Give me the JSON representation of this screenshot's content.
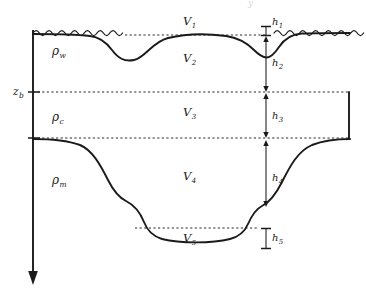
{
  "figure": {
    "caption_fragment": "y",
    "background_color": "#ffffff",
    "line_color": "#1a1a1a",
    "dash_color": "#2b2b2b"
  },
  "axis": {
    "name": "depth-axis",
    "direction": "downward",
    "tick_label": "z",
    "tick_subscript": "b",
    "tick_full": "z_b"
  },
  "densities": [
    {
      "id": "rho-w",
      "symbol": "ρ",
      "subscript": "w",
      "full": "ρ_w",
      "meaning": "water density"
    },
    {
      "id": "rho-c",
      "symbol": "ρ",
      "subscript": "c",
      "full": "ρ_c",
      "meaning": "crust density"
    },
    {
      "id": "rho-m",
      "symbol": "ρ",
      "subscript": "m",
      "full": "ρ_m",
      "meaning": "mantle density"
    }
  ],
  "volumes": [
    {
      "id": "v1",
      "symbol": "V",
      "subscript": "1",
      "full": "V_1"
    },
    {
      "id": "v2",
      "symbol": "V",
      "subscript": "2",
      "full": "V_2"
    },
    {
      "id": "v3",
      "symbol": "V",
      "subscript": "3",
      "full": "V_3"
    },
    {
      "id": "v4",
      "symbol": "V",
      "subscript": "4",
      "full": "V_4"
    },
    {
      "id": "v5",
      "symbol": "V",
      "subscript": "5",
      "full": "V_5"
    }
  ],
  "heights": [
    {
      "id": "h1",
      "symbol": "h",
      "subscript": "1",
      "full": "h_1",
      "marker": "bracket"
    },
    {
      "id": "h2",
      "symbol": "h",
      "subscript": "2",
      "full": "h_2",
      "marker": "arrow"
    },
    {
      "id": "h3",
      "symbol": "h",
      "subscript": "3",
      "full": "h_3",
      "marker": "arrow"
    },
    {
      "id": "h4",
      "symbol": "h",
      "subscript": "4",
      "full": "h_4",
      "marker": "arrow"
    },
    {
      "id": "h5",
      "symbol": "h",
      "subscript": "5",
      "full": "h_5",
      "marker": "bracket"
    }
  ],
  "features": {
    "sea_surface": "wavy-line",
    "sea_level_datum": "dashed-line",
    "topography": "solid-curve",
    "moho": "solid-curve",
    "right_block": "solid-rectangle-edge"
  }
}
